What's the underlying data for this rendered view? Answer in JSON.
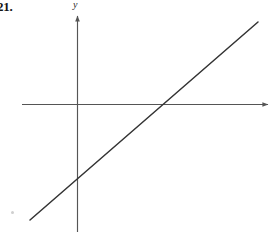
{
  "figure": {
    "exercise_number": "21.",
    "background_color": "#ffffff",
    "axis_color": "#555555",
    "line_color": "#333333",
    "label_color": "#141414"
  },
  "axes": {
    "y_axis_label": "y",
    "x_axis_label": "",
    "origin": {
      "x": 77,
      "y": 104
    },
    "x_axis": {
      "x1": 22,
      "y1": 104,
      "x2": 270,
      "y2": 104,
      "arrow_end": "right"
    },
    "y_axis": {
      "x1": 77,
      "y1": 14,
      "x2": 77,
      "y2": 232,
      "arrow_end": "top"
    }
  },
  "chart_data": {
    "type": "line",
    "title": "21.",
    "xlabel": "",
    "ylabel": "y",
    "grid": false,
    "legend": null,
    "axis_style": "cartesian-arrows",
    "tick_labels": {
      "x": [],
      "y": []
    },
    "annotations": [],
    "series": [
      {
        "name": "line",
        "description": "straight line with positive slope",
        "points_px": [
          [
            30,
            220
          ],
          [
            258,
            22
          ]
        ],
        "y_intercept_px": [
          77,
          177
        ],
        "x_intercept_px": [
          162,
          104
        ],
        "slope_sign": "positive"
      }
    ]
  }
}
